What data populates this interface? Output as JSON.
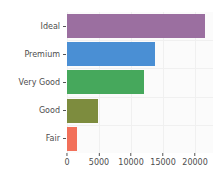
{
  "chart_data": {
    "type": "bar",
    "orientation": "horizontal",
    "title": "",
    "xlabel": "",
    "ylabel": "",
    "categories": [
      "Fair",
      "Good",
      "Very Good",
      "Premium",
      "Ideal"
    ],
    "values": [
      1610,
      4906,
      12082,
      13791,
      21551
    ],
    "bar_colors": [
      "#f2705a",
      "#7d8c3e",
      "#46a85c",
      "#4a8fd4",
      "#9b6fa0"
    ],
    "xlim": [
      0,
      22800
    ],
    "xticks": [
      0,
      5000,
      10000,
      15000,
      20000
    ],
    "xtick_labels": [
      "0",
      "5000",
      "10000",
      "15000",
      "20000"
    ],
    "ytick_labels": [
      "Fair",
      "Good",
      "Very Good",
      "Premium",
      "Ideal"
    ],
    "grid": true,
    "legend": "none",
    "panel_background": "#fbfbfb",
    "gridline_color": "#f0f0f0",
    "axis_text_color": "#4d4d4d"
  }
}
